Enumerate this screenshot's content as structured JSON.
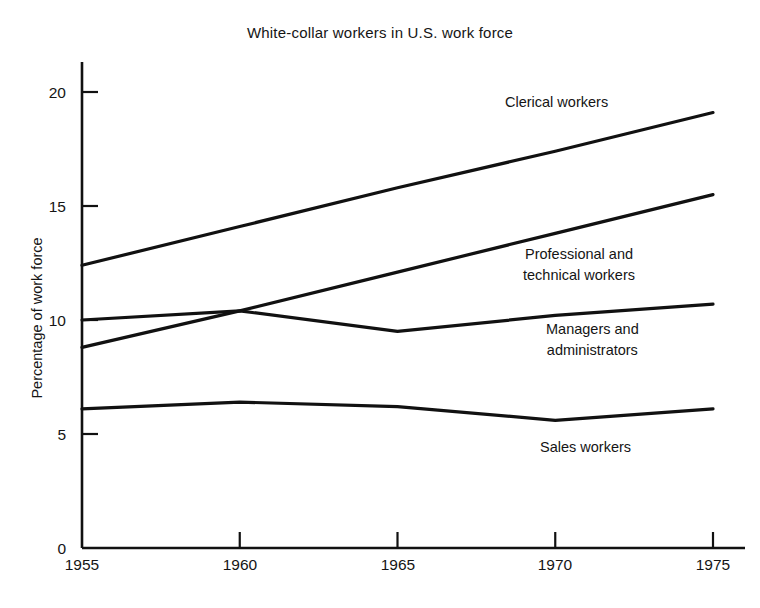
{
  "chart_data": {
    "type": "line",
    "title": "White-collar workers in U.S. work force",
    "xlabel": "",
    "ylabel": "Percentage of work force",
    "x": [
      1955,
      1960,
      1965,
      1970,
      1975
    ],
    "xtick_labels": [
      "1955",
      "1960",
      "1965",
      "1970",
      "1975"
    ],
    "ytick_labels": [
      "0",
      "5",
      "10",
      "15",
      "20"
    ],
    "yticks": [
      0,
      5,
      10,
      15,
      20
    ],
    "ylim": [
      0,
      21.5
    ],
    "xlim": [
      1955,
      1975
    ],
    "grid": false,
    "legend": "inline-labels-right",
    "line_color": "#111111",
    "background": "#ffffff",
    "series": [
      {
        "name": "Clerical workers",
        "label_lines": "Clerical workers",
        "values": [
          12.4,
          14.1,
          15.8,
          17.4,
          19.1
        ]
      },
      {
        "name": "Professional and technical workers",
        "label_lines": "Professional and\ntechnical workers",
        "values": [
          8.8,
          10.4,
          12.1,
          13.8,
          15.5
        ]
      },
      {
        "name": "Managers and administrators",
        "label_lines": "Managers and\nadministrators",
        "values": [
          10.0,
          10.4,
          9.5,
          10.2,
          10.7
        ]
      },
      {
        "name": "Sales workers",
        "label_lines": "Sales workers",
        "values": [
          6.1,
          6.4,
          6.2,
          5.6,
          6.1
        ]
      }
    ]
  },
  "labels": {
    "title": "White-collar workers in U.S. work force",
    "y_axis": "Percentage of work force",
    "ytick_0": "0",
    "ytick_5": "5",
    "ytick_10": "10",
    "ytick_15": "15",
    "ytick_20": "20",
    "xtick_1955": "1955",
    "xtick_1960": "1960",
    "xtick_1965": "1965",
    "xtick_1970": "1970",
    "xtick_1975": "1975",
    "series_clerical": "Clerical workers",
    "series_professional": "Professional and\ntechnical workers",
    "series_managers": "Managers and\nadministrators",
    "series_sales": "Sales workers"
  }
}
